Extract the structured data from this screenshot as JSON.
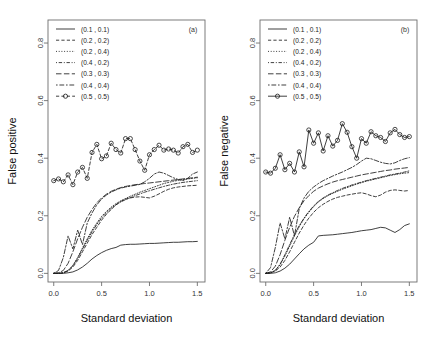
{
  "figure": {
    "background": "#ffffff",
    "ink": "#1d1d1d"
  },
  "chart_data": [
    {
      "type": "line",
      "panel_tag": "(a)",
      "title": "",
      "xlabel": "Standard deviation",
      "ylabel": "False positive",
      "xlim": [
        -0.06,
        1.58
      ],
      "ylim": [
        -0.03,
        0.88
      ],
      "xticks": [
        0.0,
        0.5,
        1.0,
        1.5
      ],
      "xticklabels": [
        "0.0",
        "0.5",
        "1.0",
        "1.5"
      ],
      "yticks": [
        0.0,
        0.2,
        0.4,
        0.6,
        0.8
      ],
      "yticklabels": [
        "0.0",
        "0.2",
        "0.4",
        "0.6",
        "0.8"
      ],
      "grid": false,
      "legend_position": "top-left",
      "x": [
        0.0,
        0.05,
        0.1,
        0.15,
        0.2,
        0.25,
        0.3,
        0.35,
        0.4,
        0.45,
        0.5,
        0.55,
        0.6,
        0.65,
        0.7,
        0.75,
        0.8,
        0.85,
        0.9,
        0.95,
        1.0,
        1.05,
        1.1,
        1.15,
        1.2,
        1.25,
        1.3,
        1.35,
        1.4,
        1.45,
        1.5
      ],
      "series": [
        {
          "name": "(0.1 , 0.1)",
          "style": "solid",
          "marker": "none",
          "values": [
            0.0,
            0.0,
            0.0,
            0.002,
            0.005,
            0.012,
            0.022,
            0.035,
            0.05,
            0.062,
            0.072,
            0.08,
            0.086,
            0.09,
            0.098,
            0.1,
            0.101,
            0.101,
            0.102,
            0.103,
            0.104,
            0.104,
            0.105,
            0.106,
            0.107,
            0.108,
            0.108,
            0.109,
            0.11,
            0.11,
            0.111
          ]
        },
        {
          "name": "(0.2 , 0.2)",
          "style": "dashed",
          "marker": "none",
          "values": [
            0.0,
            0.0,
            0.002,
            0.008,
            0.022,
            0.045,
            0.075,
            0.105,
            0.135,
            0.16,
            0.185,
            0.205,
            0.222,
            0.238,
            0.25,
            0.258,
            0.262,
            0.265,
            0.266,
            0.264,
            0.262,
            0.268,
            0.276,
            0.285,
            0.292,
            0.297,
            0.3,
            0.302,
            0.304,
            0.305,
            0.306
          ]
        },
        {
          "name": "(0.2 , 0.4)",
          "style": "dotted",
          "marker": "none",
          "values": [
            0.0,
            0.0,
            0.002,
            0.01,
            0.028,
            0.055,
            0.088,
            0.12,
            0.15,
            0.175,
            0.198,
            0.215,
            0.23,
            0.242,
            0.252,
            0.26,
            0.268,
            0.275,
            0.282,
            0.288,
            0.294,
            0.3,
            0.306,
            0.312,
            0.316,
            0.32,
            0.323,
            0.326,
            0.328,
            0.33,
            0.332
          ]
        },
        {
          "name": "(0.4 , 0.2)",
          "style": "dotdash",
          "marker": "none",
          "values": [
            0.0,
            0.0,
            0.002,
            0.01,
            0.026,
            0.052,
            0.084,
            0.115,
            0.144,
            0.17,
            0.192,
            0.21,
            0.226,
            0.238,
            0.248,
            0.256,
            0.263,
            0.27,
            0.276,
            0.282,
            0.287,
            0.292,
            0.297,
            0.302,
            0.306,
            0.31,
            0.313,
            0.316,
            0.318,
            0.32,
            0.322
          ]
        },
        {
          "name": "(0.3 , 0.3)",
          "style": "longdash",
          "marker": "none",
          "values": [
            0.0,
            0.002,
            0.01,
            0.035,
            0.075,
            0.12,
            0.16,
            0.195,
            0.222,
            0.245,
            0.262,
            0.275,
            0.285,
            0.292,
            0.298,
            0.302,
            0.305,
            0.308,
            0.31,
            0.312,
            0.314,
            0.316,
            0.318,
            0.32,
            0.322,
            0.324,
            0.326,
            0.328,
            0.33,
            0.332,
            0.334
          ]
        },
        {
          "name": "(0.4 , 0.4)",
          "style": "twodash",
          "marker": "none",
          "values": [
            0.0,
            0.01,
            0.055,
            0.13,
            0.085,
            0.15,
            0.1,
            0.175,
            0.21,
            0.238,
            0.258,
            0.272,
            0.282,
            0.29,
            0.296,
            0.3,
            0.303,
            0.306,
            0.309,
            0.318,
            0.33,
            0.345,
            0.352,
            0.348,
            0.34,
            0.332,
            0.326,
            0.322,
            0.33,
            0.345,
            0.352
          ]
        },
        {
          "name": "(0.5 , 0.5)",
          "style": "dashed",
          "marker": "circle",
          "values": [
            0.322,
            0.328,
            0.318,
            0.342,
            0.308,
            0.352,
            0.368,
            0.33,
            0.42,
            0.448,
            0.398,
            0.408,
            0.452,
            0.43,
            0.418,
            0.468,
            0.468,
            0.43,
            0.39,
            0.358,
            0.412,
            0.43,
            0.445,
            0.428,
            0.432,
            0.428,
            0.418,
            0.44,
            0.448,
            0.42,
            0.428
          ]
        }
      ]
    },
    {
      "type": "line",
      "panel_tag": "(b)",
      "title": "",
      "xlabel": "Standard deviation",
      "ylabel": "False negative",
      "xlim": [
        -0.06,
        1.58
      ],
      "ylim": [
        -0.03,
        0.88
      ],
      "xticks": [
        0.0,
        0.5,
        1.0,
        1.5
      ],
      "xticklabels": [
        "0.0",
        "0.5",
        "1.0",
        "1.5"
      ],
      "yticks": [
        0.0,
        0.2,
        0.4,
        0.6,
        0.8
      ],
      "yticklabels": [
        "0.0",
        "0.2",
        "0.4",
        "0.6",
        "0.8"
      ],
      "grid": false,
      "legend_position": "top-left",
      "x": [
        0.0,
        0.05,
        0.1,
        0.15,
        0.2,
        0.25,
        0.3,
        0.35,
        0.4,
        0.45,
        0.5,
        0.55,
        0.6,
        0.65,
        0.7,
        0.75,
        0.8,
        0.85,
        0.9,
        0.95,
        1.0,
        1.05,
        1.1,
        1.15,
        1.2,
        1.25,
        1.3,
        1.35,
        1.4,
        1.45,
        1.5
      ],
      "series": [
        {
          "name": "(0.1 , 0.1)",
          "style": "solid",
          "marker": "none",
          "values": [
            0.0,
            0.0,
            0.002,
            0.008,
            0.018,
            0.032,
            0.05,
            0.068,
            0.085,
            0.098,
            0.108,
            0.13,
            0.132,
            0.133,
            0.134,
            0.136,
            0.138,
            0.14,
            0.142,
            0.145,
            0.148,
            0.15,
            0.152,
            0.156,
            0.16,
            0.158,
            0.15,
            0.142,
            0.152,
            0.166,
            0.172
          ]
        },
        {
          "name": "(0.2 , 0.2)",
          "style": "dashed",
          "marker": "none",
          "values": [
            0.0,
            0.002,
            0.008,
            0.022,
            0.045,
            0.075,
            0.108,
            0.14,
            0.168,
            0.192,
            0.212,
            0.228,
            0.24,
            0.25,
            0.258,
            0.264,
            0.268,
            0.272,
            0.275,
            0.278,
            0.28,
            0.276,
            0.27,
            0.266,
            0.272,
            0.282,
            0.288,
            0.29,
            0.288,
            0.286,
            0.288
          ]
        },
        {
          "name": "(0.2 , 0.4)",
          "style": "dotted",
          "marker": "none",
          "values": [
            0.0,
            0.002,
            0.01,
            0.03,
            0.06,
            0.095,
            0.13,
            0.162,
            0.19,
            0.212,
            0.232,
            0.248,
            0.26,
            0.27,
            0.278,
            0.285,
            0.292,
            0.298,
            0.304,
            0.31,
            0.315,
            0.32,
            0.324,
            0.328,
            0.332,
            0.336,
            0.34,
            0.343,
            0.346,
            0.348,
            0.35
          ]
        },
        {
          "name": "(0.4 , 0.2)",
          "style": "dotdash",
          "marker": "none",
          "values": [
            0.0,
            0.002,
            0.01,
            0.032,
            0.065,
            0.1,
            0.135,
            0.166,
            0.192,
            0.215,
            0.234,
            0.25,
            0.262,
            0.272,
            0.28,
            0.288,
            0.295,
            0.301,
            0.307,
            0.312,
            0.317,
            0.322,
            0.326,
            0.33,
            0.334,
            0.338,
            0.342,
            0.345,
            0.348,
            0.352,
            0.356
          ]
        },
        {
          "name": "(0.3 , 0.3)",
          "style": "longdash",
          "marker": "none",
          "values": [
            0.0,
            0.005,
            0.025,
            0.065,
            0.115,
            0.16,
            0.198,
            0.228,
            0.252,
            0.27,
            0.285,
            0.296,
            0.304,
            0.311,
            0.317,
            0.322,
            0.326,
            0.33,
            0.334,
            0.338,
            0.342,
            0.345,
            0.348,
            0.351,
            0.354,
            0.357,
            0.359,
            0.362,
            0.364,
            0.366,
            0.368
          ]
        },
        {
          "name": "(0.4 , 0.4)",
          "style": "twodash",
          "marker": "none",
          "values": [
            0.0,
            0.02,
            0.09,
            0.175,
            0.12,
            0.195,
            0.13,
            0.225,
            0.262,
            0.285,
            0.3,
            0.312,
            0.322,
            0.33,
            0.338,
            0.345,
            0.352,
            0.36,
            0.368,
            0.378,
            0.39,
            0.4,
            0.398,
            0.392,
            0.386,
            0.382,
            0.38,
            0.384,
            0.392,
            0.398,
            0.402
          ]
        },
        {
          "name": "(0.5 , 0.5)",
          "style": "solid",
          "marker": "circle",
          "values": [
            0.352,
            0.348,
            0.365,
            0.412,
            0.36,
            0.382,
            0.352,
            0.422,
            0.37,
            0.498,
            0.452,
            0.488,
            0.425,
            0.478,
            0.442,
            0.462,
            0.52,
            0.49,
            0.44,
            0.4,
            0.468,
            0.452,
            0.492,
            0.478,
            0.472,
            0.458,
            0.488,
            0.5,
            0.482,
            0.472,
            0.475
          ]
        }
      ]
    }
  ]
}
